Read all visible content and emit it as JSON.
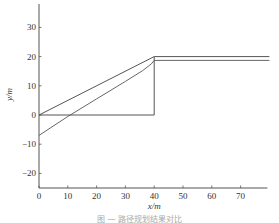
{
  "chart_data": {
    "type": "line",
    "title": "",
    "xlabel": "x/m",
    "ylabel": "y/m",
    "xlim": [
      0,
      80
    ],
    "ylim": [
      -25,
      38
    ],
    "xticks": [
      0,
      10,
      20,
      30,
      40,
      50,
      60,
      70
    ],
    "yticks": [
      -20,
      -10,
      0,
      10,
      20,
      30
    ],
    "grid": false,
    "legend": null,
    "series": [
      {
        "name": "reference-path-straight",
        "x": [
          0,
          40,
          80
        ],
        "y": [
          0,
          20,
          20
        ]
      },
      {
        "name": "tracked-path-curve",
        "x": [
          0,
          10,
          20,
          30,
          36,
          39,
          40,
          80
        ],
        "y": [
          -7,
          -0.5,
          5.5,
          11.5,
          15.2,
          17.5,
          18.7,
          18.7
        ]
      },
      {
        "name": "step-path",
        "x": [
          0,
          40,
          40
        ],
        "y": [
          0,
          0,
          20
        ]
      }
    ]
  },
  "caption": "图 — 路径规划结果对比"
}
